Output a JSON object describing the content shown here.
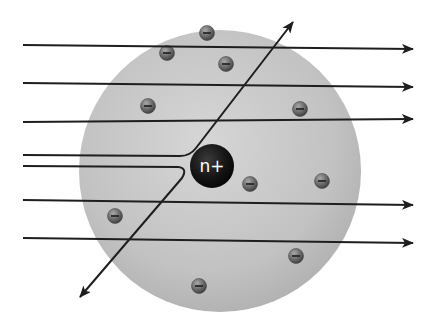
{
  "diagram": {
    "colors": {
      "background": "#ffffff",
      "sphere_fill": "#c4c4c4",
      "sphere_edge": "#a9a9a9",
      "path_stroke": "#1e1e1e",
      "nucleus_fill": "#111111",
      "nucleus_text": "#ffffff",
      "electron_fill": "#7a7a7a",
      "electron_dark": "#4a4a4a"
    },
    "sphere": {
      "cx": 220,
      "cy": 171,
      "r": 141
    },
    "nucleus": {
      "cx": 212,
      "cy": 166,
      "r": 22,
      "label": "n+"
    },
    "electron_label": "−",
    "electrons": [
      {
        "cx": 207,
        "cy": 33
      },
      {
        "cx": 167,
        "cy": 53
      },
      {
        "cx": 226,
        "cy": 64
      },
      {
        "cx": 148,
        "cy": 106
      },
      {
        "cx": 300,
        "cy": 109
      },
      {
        "cx": 250,
        "cy": 184
      },
      {
        "cx": 322,
        "cy": 181
      },
      {
        "cx": 115,
        "cy": 216
      },
      {
        "cx": 296,
        "cy": 256
      },
      {
        "cx": 199,
        "cy": 286
      }
    ],
    "straight_paths": [
      {
        "y1": 45,
        "y2": 49
      },
      {
        "y1": 83,
        "y2": 87
      },
      {
        "y1": 122,
        "y2": 119
      },
      {
        "y1": 200,
        "y2": 205
      },
      {
        "y1": 238,
        "y2": 243
      }
    ],
    "deflected_paths": [
      {
        "name": "upper-deflected-path",
        "d": "M 23 155 L 180 156 Q 190 156 196 148 L 293 22"
      },
      {
        "name": "lower-deflected-path",
        "d": "M 23 166 L 178 167 Q 188 168 182 178 L 80 297"
      }
    ]
  }
}
